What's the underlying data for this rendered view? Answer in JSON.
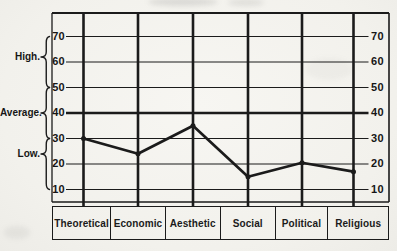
{
  "figure": {
    "paper_color": "#f4f3ef",
    "ink_color": "#1b1b1b"
  },
  "chart_data": {
    "type": "line",
    "title": "",
    "categories": [
      "Theoretical",
      "Economic",
      "Aesthetic",
      "Social",
      "Political",
      "Religious"
    ],
    "values": [
      30,
      24,
      35,
      15,
      20.5,
      17
    ],
    "yticks": [
      70,
      60,
      50,
      40,
      30,
      20,
      10
    ],
    "ytick_sides": "both",
    "ylim": [
      5,
      79
    ],
    "range_labels": [
      {
        "label": "High.",
        "from": 50,
        "to": 70
      },
      {
        "label": "Average.",
        "from": 30,
        "to": 50
      },
      {
        "label": "Low.",
        "from": 10,
        "to": 30
      }
    ],
    "grid": {
      "horizontal_at_ticks": true,
      "emphasized_at": 40,
      "vertical_category_lines": true
    },
    "legend": null,
    "series_color": "#1b1b1b"
  }
}
